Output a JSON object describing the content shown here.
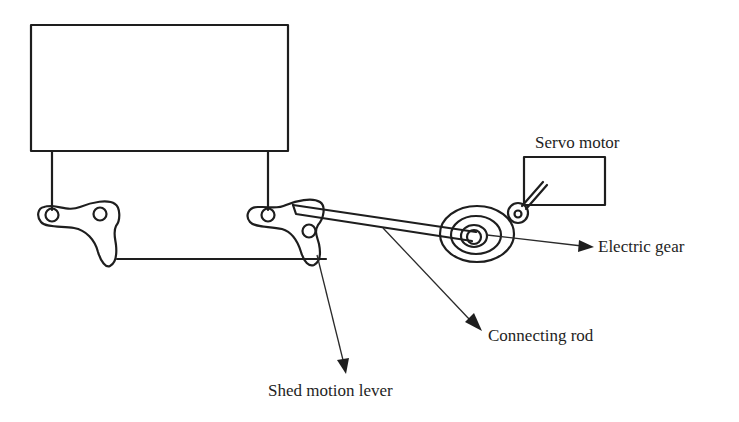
{
  "diagram": {
    "labels": {
      "servo_motor": "Servo motor",
      "electric_gear": "Electric gear",
      "connecting_rod": "Connecting rod",
      "shed_motion_lever": "Shed motion lever"
    },
    "colors": {
      "line": "#1e1e1e",
      "background": "#ffffff"
    }
  }
}
